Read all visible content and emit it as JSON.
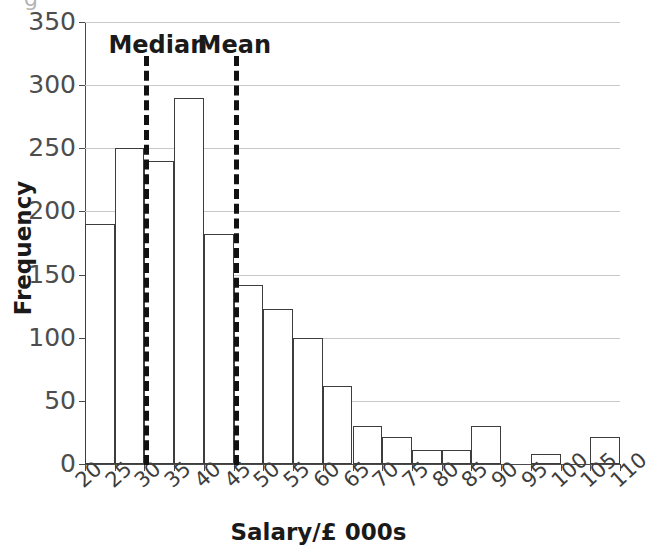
{
  "chart_data": {
    "type": "bar",
    "title": "",
    "xlabel": "Salary/£ 000s",
    "ylabel": "Frequency",
    "xlim": [
      20,
      110
    ],
    "ylim": [
      0,
      350
    ],
    "ytick_labels": [
      "0",
      "50",
      "100",
      "150",
      "200",
      "250",
      "300",
      "350"
    ],
    "ytick_values": [
      0,
      50,
      100,
      150,
      200,
      250,
      300,
      350
    ],
    "xtick_labels": [
      "20",
      "25",
      "30",
      "35",
      "40",
      "45",
      "50",
      "55",
      "60",
      "65",
      "70",
      "75",
      "80",
      "85",
      "90",
      "95",
      "100",
      "105",
      "110"
    ],
    "xtick_values": [
      20,
      25,
      30,
      35,
      40,
      45,
      50,
      55,
      60,
      65,
      70,
      75,
      80,
      85,
      90,
      95,
      100,
      105,
      110
    ],
    "bin_width": 5,
    "grid": true,
    "legend": "none",
    "categories": [
      "20-25",
      "25-30",
      "30-35",
      "35-40",
      "40-45",
      "45-50",
      "50-55",
      "55-60",
      "60-65",
      "65-70",
      "70-75",
      "75-80",
      "80-85",
      "85-90",
      "90-95",
      "95-100",
      "100-105",
      "105-110"
    ],
    "bin_starts": [
      20,
      25,
      30,
      35,
      40,
      45,
      50,
      55,
      60,
      65,
      70,
      75,
      80,
      85,
      90,
      95,
      100,
      105
    ],
    "values": [
      190,
      250,
      240,
      290,
      182,
      142,
      123,
      100,
      62,
      30,
      21,
      11,
      11,
      30,
      0,
      8,
      0,
      21
    ],
    "annotations": [
      {
        "label": "Median",
        "x": 30,
        "style": "dashed-vertical"
      },
      {
        "label": "Mean",
        "x": 45,
        "style": "dashed-vertical"
      }
    ],
    "colors": {
      "bar_fill": "#ffffff",
      "bar_edge": "#3d3d3d",
      "grid": "#c9c9c9",
      "axis": "#4a4a4a",
      "annotation": "#111111",
      "text": "#1a1a1a"
    }
  },
  "caption": {
    "sliver_text": "g"
  }
}
